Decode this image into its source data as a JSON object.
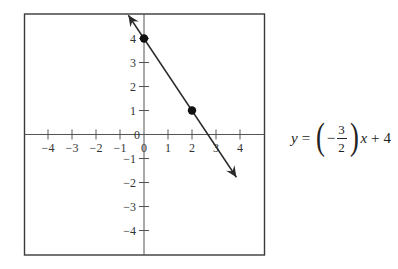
{
  "chart_data": {
    "type": "line",
    "title": "",
    "xlabel": "",
    "ylabel": "",
    "xlim": [
      -5,
      5
    ],
    "ylim": [
      -5,
      5
    ],
    "grid": false,
    "legend": null,
    "x_ticks": [
      -4,
      -3,
      -2,
      -1,
      0,
      1,
      2,
      3,
      4
    ],
    "x_tick_labels": [
      "−4",
      "−3",
      "−2",
      "−1",
      "0",
      "1",
      "2",
      "3",
      "4"
    ],
    "y_ticks": [
      -4,
      -3,
      -2,
      -1,
      0,
      1,
      2,
      3,
      4
    ],
    "y_tick_labels": [
      "−4",
      "−3",
      "−2",
      "−1",
      "0",
      "1",
      "2",
      "3",
      "4"
    ],
    "series": [
      {
        "name": "y = (-3/2)x + 4",
        "slope": -1.5,
        "intercept": 4,
        "x": [
          -0.65,
          3.85
        ],
        "y": [
          4.97,
          -1.78
        ],
        "arrows_both_ends": true,
        "color": "#2a2a2a"
      }
    ],
    "points": [
      {
        "x": 0,
        "y": 4
      },
      {
        "x": 2,
        "y": 1
      }
    ],
    "annotations": [
      {
        "text": "y = (−3/2)x + 4",
        "position": "right of plot"
      }
    ]
  },
  "equation": {
    "lhs": "y",
    "equals": "=",
    "open_paren": "(",
    "sign": "−",
    "numerator": "3",
    "denominator": "2",
    "close_paren": ")",
    "variable": "x",
    "plus": "+",
    "constant": "4"
  },
  "style": {
    "frame_color": "#3a3a3a",
    "axis_color": "#555555",
    "line_color": "#2a2a2a",
    "point_color": "#111111"
  }
}
